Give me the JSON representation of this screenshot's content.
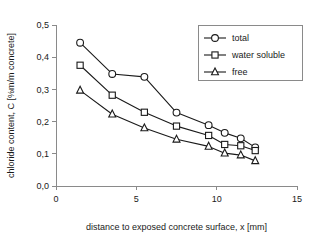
{
  "chart_data": {
    "type": "line",
    "title": "",
    "xlabel": "distance to exposed concrete surface, x [mm]",
    "ylabel": "chloride content, C [%m/m concrete]",
    "xlim": [
      0,
      15
    ],
    "ylim": [
      0.0,
      0.5
    ],
    "xticks": [
      0,
      5,
      10,
      15
    ],
    "xtick_labels": [
      "0",
      "5",
      "10",
      "15"
    ],
    "yticks": [
      0.0,
      0.1,
      0.2,
      0.3,
      0.4,
      0.5
    ],
    "ytick_labels": [
      "0,0",
      "0,1",
      "0,2",
      "0,3",
      "0,4",
      "0,5"
    ],
    "grid": false,
    "legend_position": "top-right",
    "decimal_separator": ",",
    "series": [
      {
        "name": "total",
        "marker": "circle",
        "x": [
          1.5,
          3.5,
          5.5,
          7.5,
          9.5,
          10.5,
          11.5,
          12.4
        ],
        "values": [
          0.445,
          0.348,
          0.339,
          0.228,
          0.189,
          0.165,
          0.148,
          0.12
        ]
      },
      {
        "name": "water soluble",
        "marker": "square",
        "x": [
          1.5,
          3.5,
          5.5,
          7.5,
          9.5,
          10.5,
          11.5,
          12.4
        ],
        "values": [
          0.375,
          0.282,
          0.229,
          0.186,
          0.157,
          0.129,
          0.125,
          0.11
        ]
      },
      {
        "name": "free",
        "marker": "triangle",
        "x": [
          1.5,
          3.5,
          5.5,
          7.5,
          9.5,
          10.5,
          11.5,
          12.4
        ],
        "values": [
          0.297,
          0.223,
          0.18,
          0.145,
          0.123,
          0.102,
          0.096,
          0.078
        ]
      }
    ]
  },
  "legend": {
    "items": [
      {
        "label": "total",
        "marker": "circle"
      },
      {
        "label": "water soluble",
        "marker": "square"
      },
      {
        "label": "free",
        "marker": "triangle"
      }
    ]
  },
  "colors": {
    "background": "#ffffff",
    "axis": "#8a8a8a",
    "ink": "#1a1a1a",
    "marker_fill": "#ffffff"
  }
}
